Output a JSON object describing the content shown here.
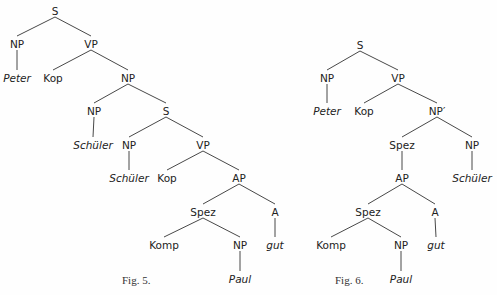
{
  "figures": [
    {
      "caption": "Fig. 5.",
      "caption_pos": [
        122,
        284
      ],
      "nodes": [
        {
          "id": "S",
          "label": "S",
          "x": 55,
          "y": 12
        },
        {
          "id": "NP1",
          "label": "NP",
          "x": 17,
          "y": 45
        },
        {
          "id": "VP1",
          "label": "VP",
          "x": 91,
          "y": 45
        },
        {
          "id": "Peter",
          "label": "Peter",
          "x": 17,
          "y": 79,
          "italic": true
        },
        {
          "id": "Kop1",
          "label": "Kop",
          "x": 53,
          "y": 79
        },
        {
          "id": "NP2",
          "label": "NP",
          "x": 128,
          "y": 79
        },
        {
          "id": "NP3",
          "label": "NP",
          "x": 94,
          "y": 112
        },
        {
          "id": "S2",
          "label": "S",
          "x": 166,
          "y": 112
        },
        {
          "id": "Schueler1",
          "label": "Schüler",
          "x": 93,
          "y": 146,
          "italic": true
        },
        {
          "id": "NP4",
          "label": "NP",
          "x": 129,
          "y": 146
        },
        {
          "id": "VP2",
          "label": "VP",
          "x": 203,
          "y": 146
        },
        {
          "id": "Schueler2",
          "label": "Schüler",
          "x": 129,
          "y": 179,
          "italic": true
        },
        {
          "id": "Kop2",
          "label": "Kop",
          "x": 167,
          "y": 179
        },
        {
          "id": "AP",
          "label": "AP",
          "x": 239,
          "y": 179
        },
        {
          "id": "Spez",
          "label": "Spez",
          "x": 203,
          "y": 213
        },
        {
          "id": "A",
          "label": "A",
          "x": 275,
          "y": 213
        },
        {
          "id": "Komp",
          "label": "Komp",
          "x": 164,
          "y": 246
        },
        {
          "id": "NP5",
          "label": "NP",
          "x": 240,
          "y": 246
        },
        {
          "id": "gut",
          "label": "gut",
          "x": 275,
          "y": 246,
          "italic": true
        },
        {
          "id": "Paul",
          "label": "Paul",
          "x": 240,
          "y": 280,
          "italic": true
        }
      ],
      "edges": [
        [
          "S",
          "NP1"
        ],
        [
          "S",
          "VP1"
        ],
        [
          "NP1",
          "Peter"
        ],
        [
          "VP1",
          "Kop1"
        ],
        [
          "VP1",
          "NP2"
        ],
        [
          "NP2",
          "NP3"
        ],
        [
          "NP2",
          "S2"
        ],
        [
          "NP3",
          "Schueler1"
        ],
        [
          "S2",
          "NP4"
        ],
        [
          "S2",
          "VP2"
        ],
        [
          "NP4",
          "Schueler2"
        ],
        [
          "VP2",
          "Kop2"
        ],
        [
          "VP2",
          "AP"
        ],
        [
          "AP",
          "Spez"
        ],
        [
          "AP",
          "A"
        ],
        [
          "Spez",
          "Komp"
        ],
        [
          "Spez",
          "NP5"
        ],
        [
          "NP5",
          "Paul"
        ],
        [
          "A",
          "gut"
        ]
      ]
    },
    {
      "caption": "Fig. 6.",
      "caption_pos": [
        335,
        284
      ],
      "nodes": [
        {
          "id": "S",
          "label": "S",
          "x": 360,
          "y": 46
        },
        {
          "id": "NP1",
          "label": "NP",
          "x": 327,
          "y": 79
        },
        {
          "id": "VP1",
          "label": "VP",
          "x": 398,
          "y": 79
        },
        {
          "id": "Peter",
          "label": "Peter",
          "x": 327,
          "y": 112,
          "italic": true
        },
        {
          "id": "Kop",
          "label": "Kop",
          "x": 364,
          "y": 112
        },
        {
          "id": "NPp",
          "label": "NP′",
          "x": 437,
          "y": 112
        },
        {
          "id": "Spez1",
          "label": "Spez",
          "x": 402,
          "y": 146
        },
        {
          "id": "NP2",
          "label": "NP",
          "x": 472,
          "y": 146
        },
        {
          "id": "AP",
          "label": "AP",
          "x": 402,
          "y": 179
        },
        {
          "id": "Schueler",
          "label": "Schüler",
          "x": 472,
          "y": 179,
          "italic": true
        },
        {
          "id": "Spez2",
          "label": "Spez",
          "x": 368,
          "y": 213
        },
        {
          "id": "A",
          "label": "A",
          "x": 435,
          "y": 213
        },
        {
          "id": "Komp",
          "label": "Komp",
          "x": 331,
          "y": 246
        },
        {
          "id": "NP3",
          "label": "NP",
          "x": 401,
          "y": 246
        },
        {
          "id": "gut",
          "label": "gut",
          "x": 436,
          "y": 246,
          "italic": true
        },
        {
          "id": "Paul",
          "label": "Paul",
          "x": 401,
          "y": 280,
          "italic": true
        }
      ],
      "edges": [
        [
          "S",
          "NP1"
        ],
        [
          "S",
          "VP1"
        ],
        [
          "NP1",
          "Peter"
        ],
        [
          "VP1",
          "Kop"
        ],
        [
          "VP1",
          "NPp"
        ],
        [
          "NPp",
          "Spez1"
        ],
        [
          "NPp",
          "NP2"
        ],
        [
          "Spez1",
          "AP"
        ],
        [
          "NP2",
          "Schueler"
        ],
        [
          "AP",
          "Spez2"
        ],
        [
          "AP",
          "A"
        ],
        [
          "Spez2",
          "Komp"
        ],
        [
          "Spez2",
          "NP3"
        ],
        [
          "NP3",
          "Paul"
        ],
        [
          "A",
          "gut"
        ]
      ]
    }
  ]
}
